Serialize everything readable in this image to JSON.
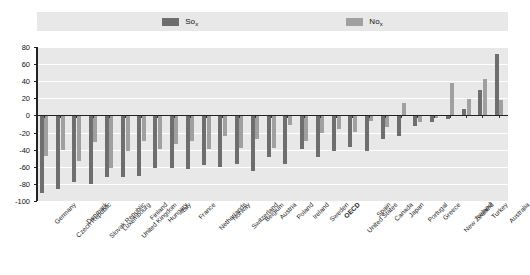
{
  "legend": {
    "items": [
      {
        "name": "so",
        "label": "So",
        "sub": "x",
        "color": "#6e6e6e"
      },
      {
        "name": "no",
        "label": "No",
        "sub": "x",
        "color": "#a0a0a0"
      }
    ]
  },
  "chart_data": {
    "type": "bar",
    "title": "",
    "subtitle": "",
    "xlabel": "",
    "ylabel": "",
    "ylim": [
      -100,
      80
    ],
    "ytick_labels": [
      "80",
      "60",
      "40",
      "20",
      "0",
      "-20",
      "-40",
      "-60",
      "-80",
      "-100"
    ],
    "ytick_values": [
      80,
      60,
      40,
      20,
      0,
      -20,
      -40,
      -60,
      -80,
      -100
    ],
    "grid": true,
    "legend_position": "top",
    "orientation": "vertical",
    "categories": [
      "Germany",
      "Czech Republic",
      "Denmark",
      "Slovak Republic",
      "Luxembourg",
      "United Kingdom",
      "Finland",
      "Hungary",
      "Italy",
      "France",
      "Netherlands",
      "Norway",
      "Switzerland",
      "Belgium",
      "Austria",
      "Poland",
      "Ireland",
      "Sweden",
      "OECD",
      "United States",
      "Spain",
      "Canada",
      "Japan",
      "Portugal",
      "Greece",
      "New Zealand",
      "Iceland",
      "Turkey",
      "Australia"
    ],
    "highlight_category": "OECD",
    "series": [
      {
        "name": "So",
        "color": "#6e6e6e",
        "values": [
          -91,
          -86,
          -78,
          -80,
          -72,
          -72,
          -71,
          -61,
          -61,
          -63,
          -58,
          -60,
          -57,
          -65,
          -49,
          -57,
          -39,
          -49,
          -42,
          -37,
          -42,
          -27,
          -24,
          -12,
          -8,
          -4,
          8,
          30,
          72
        ]
      },
      {
        "name": "No",
        "color": "#a0a0a0",
        "values": [
          -47,
          -40,
          -53,
          -31,
          -62,
          -41,
          -30,
          -39,
          -33,
          -30,
          -39,
          -24,
          -38,
          -27,
          -38,
          -11,
          -30,
          -21,
          -16,
          -19,
          -6,
          -14,
          14,
          -8,
          -3,
          38,
          19,
          43,
          18
        ]
      }
    ]
  }
}
